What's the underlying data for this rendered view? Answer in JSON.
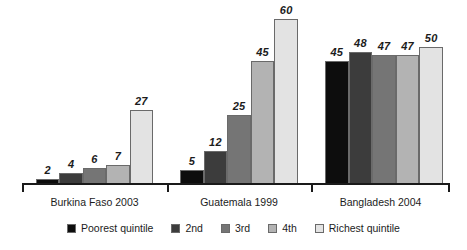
{
  "chart_data": {
    "type": "bar",
    "title": "",
    "subtitle": "",
    "xlabel": "",
    "ylabel": "",
    "ylim": [
      0,
      62
    ],
    "grid": false,
    "legend_position": "bottom",
    "categories": [
      "Burkina Faso 2003",
      "Guatemala 1999",
      "Bangladesh 2004"
    ],
    "series": [
      {
        "name": "Poorest quintile",
        "color": "#0d0d0d",
        "values": [
          2,
          5,
          45
        ]
      },
      {
        "name": "2nd",
        "color": "#3c3c3c",
        "values": [
          4,
          12,
          48
        ]
      },
      {
        "name": "3rd",
        "color": "#757575",
        "values": [
          6,
          25,
          47
        ]
      },
      {
        "name": "4th",
        "color": "#b3b3b3",
        "values": [
          7,
          45,
          47
        ]
      },
      {
        "name": "Richest quintile",
        "color": "#e3e3e3",
        "values": [
          27,
          60,
          50
        ]
      }
    ]
  },
  "axis": {
    "ticks": [
      "",
      "",
      "",
      ""
    ]
  },
  "groups": [
    {
      "label": "Burkina Faso 2003",
      "bars": [
        {
          "value": "2",
          "series": "Poorest quintile"
        },
        {
          "value": "4",
          "series": "2nd"
        },
        {
          "value": "6",
          "series": "3rd"
        },
        {
          "value": "7",
          "series": "4th"
        },
        {
          "value": "27",
          "series": "Richest quintile"
        }
      ]
    },
    {
      "label": "Guatemala 1999",
      "bars": [
        {
          "value": "5",
          "series": "Poorest quintile"
        },
        {
          "value": "12",
          "series": "2nd"
        },
        {
          "value": "25",
          "series": "3rd"
        },
        {
          "value": "45",
          "series": "4th"
        },
        {
          "value": "60",
          "series": "Richest quintile"
        }
      ]
    },
    {
      "label": "Bangladesh 2004",
      "bars": [
        {
          "value": "45",
          "series": "Poorest quintile"
        },
        {
          "value": "48",
          "series": "2nd"
        },
        {
          "value": "47",
          "series": "3rd"
        },
        {
          "value": "47",
          "series": "4th"
        },
        {
          "value": "50",
          "series": "Richest quintile"
        }
      ]
    }
  ],
  "legend": {
    "items": [
      {
        "label": "Poorest quintile",
        "color": "#0d0d0d"
      },
      {
        "label": "2nd",
        "color": "#3c3c3c"
      },
      {
        "label": "3rd",
        "color": "#757575"
      },
      {
        "label": "4th",
        "color": "#b3b3b3"
      },
      {
        "label": "Richest quintile",
        "color": "#e3e3e3"
      }
    ]
  }
}
